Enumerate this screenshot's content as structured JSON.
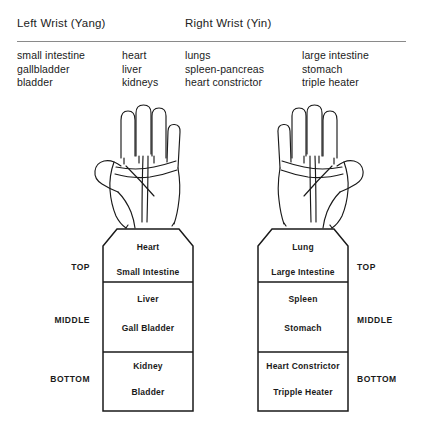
{
  "headers": {
    "left": "Left Wrist (Yang)",
    "right": "Right Wrist (Yin)"
  },
  "organ_columns": [
    {
      "name": "left-yang-column-1",
      "items": [
        "small intestine",
        "gallbladder",
        "bladder"
      ]
    },
    {
      "name": "left-yang-column-2",
      "items": [
        "heart",
        "liver",
        "kidneys"
      ]
    },
    {
      "name": "right-yin-column-1",
      "items": [
        "lungs",
        "spleen-pancreas",
        "heart constrictor"
      ]
    },
    {
      "name": "right-yin-column-2",
      "items": [
        "large intestine",
        "stomach",
        "triple heater"
      ]
    }
  ],
  "hands": {
    "left": "left-hand-palm-illustration",
    "right": "right-hand-palm-illustration"
  },
  "position_labels": {
    "top": "TOP",
    "middle": "MIDDLE",
    "bottom": "BOTTOM"
  },
  "left_wrist_chart": {
    "rows": [
      {
        "position": "TOP",
        "upper": "Heart",
        "lower": "Small Intestine"
      },
      {
        "position": "MIDDLE",
        "upper": "Liver",
        "lower": "Gall Bladder"
      },
      {
        "position": "BOTTOM",
        "upper": "Kidney",
        "lower": "Bladder"
      }
    ]
  },
  "right_wrist_chart": {
    "rows": [
      {
        "position": "TOP",
        "upper": "Lung",
        "lower": "Large Intestine"
      },
      {
        "position": "MIDDLE",
        "upper": "Spleen",
        "lower": "Stomach"
      },
      {
        "position": "BOTTOM",
        "upper": "Heart Constrictor",
        "lower": "Tripple Heater"
      }
    ]
  },
  "colors": {
    "ink": "#1a1a1a",
    "rule": "#8a8a8a",
    "background": "#ffffff"
  }
}
